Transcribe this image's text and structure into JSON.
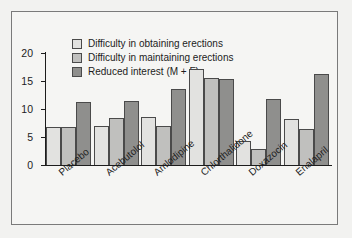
{
  "chart_data": {
    "type": "bar",
    "title": "",
    "xlabel": "",
    "ylabel": "Percent of patients",
    "ylim": [
      0,
      20
    ],
    "yticks": [
      "0",
      "5",
      "10",
      "15",
      "20"
    ],
    "grid": false,
    "legend_position": "top-left",
    "categories": [
      "Placebo",
      "Acebutolol",
      "Amlodipine",
      "Chlorthalidone",
      "Doxazocin",
      "Enalapril"
    ],
    "series": [
      {
        "name": "Difficulty in obtaining erections",
        "color": "#e2e2e0",
        "values": [
          6.8,
          7.0,
          8.6,
          17.2,
          4.2,
          8.2
        ]
      },
      {
        "name": "Difficulty in maintaining erections",
        "color": "#c0c0be",
        "values": [
          6.8,
          8.4,
          7.0,
          15.6,
          2.8,
          6.5
        ]
      },
      {
        "name": "Reduced interest (M + F)",
        "color": "#8f8f8d",
        "values": [
          11.3,
          11.4,
          13.5,
          15.4,
          11.7,
          16.2
        ]
      }
    ]
  }
}
